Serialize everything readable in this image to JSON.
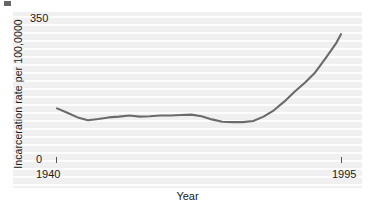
{
  "figure": {
    "background_color": "#ffffff",
    "panel_color": "#f0f0f0",
    "line_color": "#6b6b6b"
  },
  "axes": {
    "ylabel": "Incarceration rate per 100,0000",
    "xlabel": "Year",
    "ytick_top": "350",
    "ytick_bottom": "0",
    "xtick_left": "1940",
    "xtick_right": "1995"
  },
  "chart_data": {
    "type": "line",
    "title": "",
    "xlabel": "Year",
    "ylabel": "Incarceration rate per 100,0000",
    "xlim": [
      1940,
      1995
    ],
    "ylim": [
      0,
      350
    ],
    "xticks": [
      1940,
      1995
    ],
    "xticklabels": [
      "1940",
      "1995"
    ],
    "yticks": [
      0,
      350
    ],
    "yticklabels": [
      "0",
      "350"
    ],
    "grid": false,
    "legend": false,
    "series": [
      {
        "name": "Incarceration rate",
        "x": [
          1940,
          1942,
          1944,
          1946,
          1948,
          1950,
          1952,
          1954,
          1956,
          1958,
          1960,
          1962,
          1964,
          1966,
          1968,
          1970,
          1972,
          1974,
          1976,
          1978,
          1980,
          1982,
          1984,
          1986,
          1988,
          1990,
          1992,
          1994,
          1995
        ],
        "y": [
          131,
          120,
          108,
          101,
          104,
          108,
          110,
          113,
          110,
          111,
          113,
          113,
          114,
          115,
          111,
          103,
          97,
          96,
          96,
          99,
          110,
          126,
          148,
          173,
          196,
          222,
          258,
          295,
          319
        ]
      }
    ]
  }
}
